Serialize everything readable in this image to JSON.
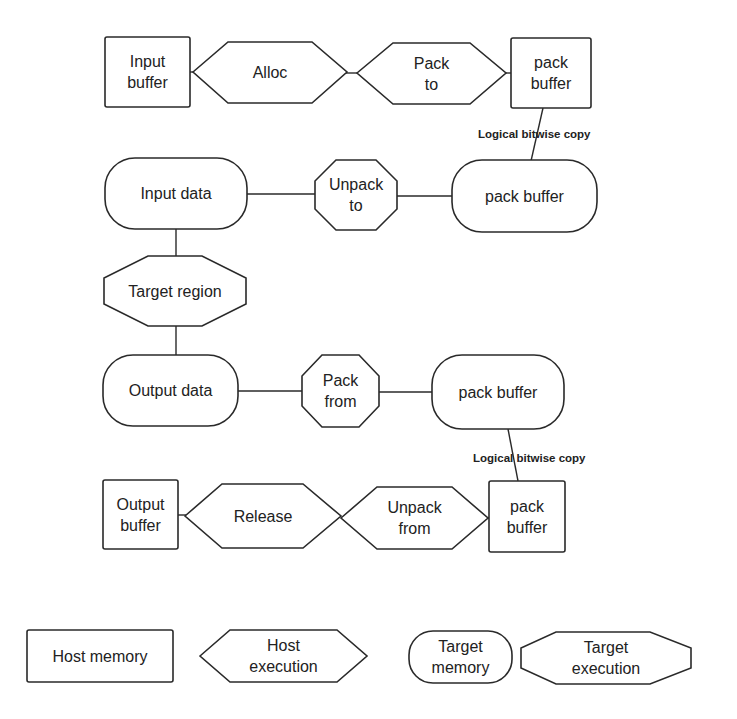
{
  "nodes": {
    "input_buffer": {
      "label": "Input\nbuffer",
      "kind": "Host memory"
    },
    "alloc": {
      "label": "Alloc",
      "kind": "Host execution"
    },
    "pack_to": {
      "label": "Pack\nto",
      "kind": "Host execution"
    },
    "pack_buffer_host_top": {
      "label": "pack\nbuffer",
      "kind": "Host memory"
    },
    "input_data": {
      "label": "Input data",
      "kind": "Target memory"
    },
    "unpack_to": {
      "label": "Unpack\nto",
      "kind": "Target execution"
    },
    "pack_buffer_target_top": {
      "label": "pack buffer",
      "kind": "Target memory"
    },
    "target_region": {
      "label": "Target region",
      "kind": "Target execution"
    },
    "output_data": {
      "label": "Output data",
      "kind": "Target memory"
    },
    "pack_from": {
      "label": "Pack\nfrom",
      "kind": "Target execution"
    },
    "pack_buffer_target_bottom": {
      "label": "pack buffer",
      "kind": "Target memory"
    },
    "output_buffer": {
      "label": "Output\nbuffer",
      "kind": "Host memory"
    },
    "release": {
      "label": "Release",
      "kind": "Host execution"
    },
    "unpack_from": {
      "label": "Unpack\nfrom",
      "kind": "Host execution"
    },
    "pack_buffer_host_bottom": {
      "label": "pack\nbuffer",
      "kind": "Host memory"
    }
  },
  "edge_labels": {
    "copy_top": "Logical bitwise copy",
    "copy_bottom": "Logical bitwise copy"
  },
  "edges": [
    [
      "input_buffer",
      "alloc"
    ],
    [
      "alloc",
      "pack_to"
    ],
    [
      "pack_to",
      "pack_buffer_host_top"
    ],
    [
      "pack_buffer_host_top",
      "pack_buffer_target_top",
      "Logical bitwise copy"
    ],
    [
      "input_data",
      "unpack_to"
    ],
    [
      "unpack_to",
      "pack_buffer_target_top"
    ],
    [
      "input_data",
      "target_region"
    ],
    [
      "target_region",
      "output_data"
    ],
    [
      "output_data",
      "pack_from"
    ],
    [
      "pack_from",
      "pack_buffer_target_bottom"
    ],
    [
      "pack_buffer_target_bottom",
      "pack_buffer_host_bottom",
      "Logical bitwise copy"
    ],
    [
      "output_buffer",
      "release"
    ],
    [
      "release",
      "unpack_from"
    ],
    [
      "unpack_from",
      "pack_buffer_host_bottom"
    ]
  ],
  "legend": {
    "host_memory": "Host memory",
    "host_execution": "Host\nexecution",
    "target_memory": "Target\nmemory",
    "target_execution": "Target\nexecution"
  }
}
